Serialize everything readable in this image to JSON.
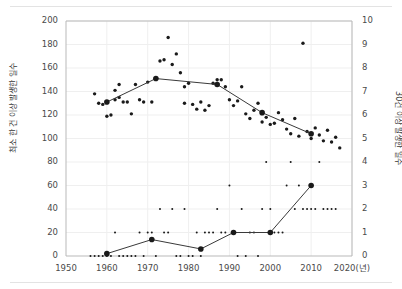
{
  "figure": {
    "background": "#ffffff",
    "border_color": "#e3e3e3",
    "axis_color": "#b9b9b9",
    "grid_color": "#efefef",
    "marker_color": "#1a1a1a",
    "line_color": "#3a3a3a"
  },
  "chart_data": {
    "type": "scatter",
    "title": "",
    "xlabel": "",
    "xlabel_unit": "2020(년)",
    "grid": true,
    "legend": "none",
    "xlim": [
      1950,
      2020
    ],
    "x_ticks": [
      1950,
      1960,
      1970,
      1980,
      1990,
      2000,
      2010,
      2020
    ],
    "x_tick_labels": [
      "1950",
      "1960",
      "1970",
      "1980",
      "1990",
      "2000",
      "2010",
      "2020(년)"
    ],
    "y_left": {
      "label": "최소 한 건 이상 발생한 일수",
      "ylim": [
        0,
        200
      ],
      "ticks": [
        0,
        20,
        40,
        60,
        80,
        100,
        120,
        140,
        160,
        180,
        200
      ],
      "tick_labels": [
        "0",
        "20",
        "40",
        "60",
        "80",
        "100",
        "120",
        "140",
        "160",
        "180",
        "200"
      ]
    },
    "y_right": {
      "label": "30건 이상 발생한 일수",
      "ylim": [
        0,
        10
      ],
      "ticks": [
        0,
        1,
        2,
        3,
        4,
        5,
        6,
        7,
        8,
        9,
        10
      ],
      "tick_labels": [
        "0",
        "1",
        "2",
        "3",
        "4",
        "5",
        "6",
        "7",
        "8",
        "9",
        "10"
      ]
    },
    "series": [
      {
        "name": "최소 한 건 이상 발생한 일수 (연간)",
        "axis": "left",
        "type": "scatter",
        "points": [
          [
            1957,
            138
          ],
          [
            1958,
            130
          ],
          [
            1959,
            129
          ],
          [
            1960,
            131
          ],
          [
            1960,
            119
          ],
          [
            1961,
            120
          ],
          [
            1962,
            133
          ],
          [
            1962,
            141
          ],
          [
            1963,
            135
          ],
          [
            1963,
            146
          ],
          [
            1964,
            131
          ],
          [
            1965,
            131
          ],
          [
            1966,
            121
          ],
          [
            1967,
            146
          ],
          [
            1968,
            133
          ],
          [
            1969,
            131
          ],
          [
            1970,
            148
          ],
          [
            1971,
            131
          ],
          [
            1972,
            151
          ],
          [
            1973,
            166
          ],
          [
            1974,
            167
          ],
          [
            1975,
            186
          ],
          [
            1976,
            163
          ],
          [
            1977,
            172
          ],
          [
            1978,
            156
          ],
          [
            1979,
            144
          ],
          [
            1979,
            130
          ],
          [
            1980,
            147
          ],
          [
            1981,
            129
          ],
          [
            1982,
            125
          ],
          [
            1983,
            131
          ],
          [
            1984,
            124
          ],
          [
            1985,
            128
          ],
          [
            1986,
            147
          ],
          [
            1987,
            150
          ],
          [
            1988,
            150
          ],
          [
            1989,
            144
          ],
          [
            1990,
            133
          ],
          [
            1991,
            128
          ],
          [
            1992,
            132
          ],
          [
            1993,
            144
          ],
          [
            1994,
            121
          ],
          [
            1995,
            117
          ],
          [
            1996,
            124
          ],
          [
            1997,
            130
          ],
          [
            1998,
            114
          ],
          [
            1999,
            118
          ],
          [
            2000,
            112
          ],
          [
            2001,
            113
          ],
          [
            2002,
            122
          ],
          [
            2003,
            116
          ],
          [
            2004,
            108
          ],
          [
            2005,
            104
          ],
          [
            2006,
            117
          ],
          [
            2007,
            102
          ],
          [
            2008,
            181
          ],
          [
            2009,
            106
          ],
          [
            2010,
            100
          ],
          [
            2011,
            109
          ],
          [
            2012,
            103
          ],
          [
            2013,
            98
          ],
          [
            2014,
            107
          ],
          [
            2015,
            97
          ],
          [
            2016,
            101
          ],
          [
            2017,
            92
          ]
        ]
      },
      {
        "name": "10년 평균 (최소 한 건 이상)",
        "axis": "left",
        "type": "line",
        "points": [
          [
            1960,
            131
          ],
          [
            1972,
            151
          ],
          [
            1987,
            146
          ],
          [
            1998,
            122
          ],
          [
            2010,
            104
          ]
        ]
      },
      {
        "name": "30건 이상 발생한 일수 (연간)",
        "axis": "right",
        "type": "scatter",
        "points": [
          [
            1956,
            0
          ],
          [
            1957,
            0
          ],
          [
            1958,
            0
          ],
          [
            1959,
            0
          ],
          [
            1960,
            0
          ],
          [
            1961,
            0
          ],
          [
            1962,
            1
          ],
          [
            1963,
            0
          ],
          [
            1964,
            0
          ],
          [
            1965,
            0
          ],
          [
            1966,
            0
          ],
          [
            1967,
            0
          ],
          [
            1968,
            1
          ],
          [
            1969,
            0
          ],
          [
            1970,
            1
          ],
          [
            1971,
            1
          ],
          [
            1972,
            0
          ],
          [
            1973,
            2
          ],
          [
            1974,
            1
          ],
          [
            1975,
            1
          ],
          [
            1976,
            2
          ],
          [
            1977,
            0
          ],
          [
            1978,
            0
          ],
          [
            1979,
            2
          ],
          [
            1980,
            0
          ],
          [
            1981,
            0
          ],
          [
            1982,
            1
          ],
          [
            1983,
            0
          ],
          [
            1984,
            1
          ],
          [
            1985,
            1
          ],
          [
            1986,
            1
          ],
          [
            1987,
            2
          ],
          [
            1988,
            1
          ],
          [
            1989,
            1
          ],
          [
            1990,
            3
          ],
          [
            1991,
            1
          ],
          [
            1992,
            0
          ],
          [
            1993,
            2
          ],
          [
            1994,
            0
          ],
          [
            1995,
            1
          ],
          [
            1996,
            1
          ],
          [
            1997,
            0
          ],
          [
            1998,
            2
          ],
          [
            1999,
            4
          ],
          [
            2000,
            2
          ],
          [
            2001,
            1
          ],
          [
            2002,
            1
          ],
          [
            2003,
            1
          ],
          [
            2004,
            3
          ],
          [
            2005,
            4
          ],
          [
            2006,
            2
          ],
          [
            2007,
            3
          ],
          [
            2008,
            2
          ],
          [
            2009,
            2
          ],
          [
            2010,
            2
          ],
          [
            2011,
            2
          ],
          [
            2012,
            4
          ],
          [
            2013,
            2
          ],
          [
            2014,
            2
          ],
          [
            2015,
            2
          ],
          [
            2016,
            2
          ]
        ]
      },
      {
        "name": "10년 평균 (30건 이상)",
        "axis": "right",
        "type": "line",
        "points": [
          [
            1960,
            0.1
          ],
          [
            1971,
            0.7
          ],
          [
            1983,
            0.3
          ],
          [
            1991,
            1.0
          ],
          [
            2000,
            1.0
          ],
          [
            2010,
            3.0
          ]
        ]
      }
    ]
  }
}
